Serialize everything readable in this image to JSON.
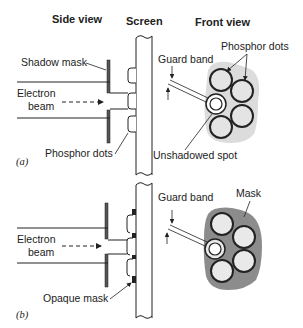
{
  "headers": {
    "side_view": "Side view",
    "screen": "Screen",
    "front_view": "Front view"
  },
  "panel_a": {
    "part_label": "(a)",
    "labels": {
      "shadow_mask": "Shadow mask",
      "electron_beam_line1": "Electron",
      "electron_beam_line2": "beam",
      "phosphor_dots_side": "Phosphor dots",
      "guard_band": "Guard band",
      "phosphor_dots_front": "Phosphor dots",
      "unshadowed_spot": "Unshadowed spot"
    }
  },
  "panel_b": {
    "part_label": "(b)",
    "labels": {
      "electron_beam_line1": "Electron",
      "electron_beam_line2": "beam",
      "opaque_mask": "Opaque mask",
      "guard_band": "Guard band",
      "mask": "Mask"
    }
  },
  "colors": {
    "ink": "#222222",
    "light_gray_blob": "#dcdcdc",
    "dark_gray_mask": "#8c8c8c",
    "dot_fill_a": "#e4e4e4",
    "dot_fill_b": "#e9e9e9"
  }
}
